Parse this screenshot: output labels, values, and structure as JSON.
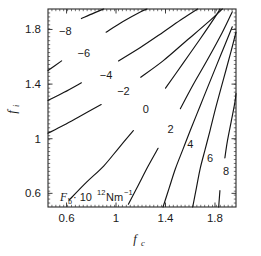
{
  "chart_data": {
    "type": "line",
    "title": "",
    "subtitle": "",
    "xlabel": "f_c",
    "ylabel": "f_i",
    "xlabel_base": "f",
    "xlabel_sub": "c",
    "ylabel_base": "f",
    "ylabel_sub": "i",
    "annotation": "F_b · 10^12 Nm^-1",
    "annotation_parts": {
      "base": "F",
      "sub": "b",
      "mid": "· 10",
      "sup": "12",
      "unit": "Nm",
      "unit_sup": "−1"
    },
    "grid": false,
    "legend": "none",
    "xlim": [
      0.45,
      1.97
    ],
    "ylim": [
      0.5,
      1.95
    ],
    "xticks": [
      0.6,
      1.0,
      1.4,
      1.8
    ],
    "xticklabels": [
      "0.6",
      "1",
      "1.4",
      "1.8"
    ],
    "yticks": [
      0.6,
      1.0,
      1.4,
      1.8
    ],
    "yticklabels": [
      "0.6",
      "1",
      "1.4",
      "1.8"
    ],
    "contour_levels": [
      -8,
      -6,
      -4,
      -2,
      0,
      2,
      4,
      6,
      8
    ],
    "contour_labels": [
      "−8",
      "−6",
      "−4",
      "−2",
      "0",
      "2",
      "4",
      "6",
      "8"
    ],
    "contours": [
      {
        "level": -8,
        "label": "−8",
        "label_xy": [
          0.59,
          1.79
        ],
        "points": [
          [
            0.45,
            1.73
          ],
          [
            0.56,
            1.8
          ],
          [
            0.63,
            1.84
          ],
          [
            0.72,
            1.88
          ],
          [
            0.82,
            1.92
          ],
          [
            0.9,
            1.95
          ]
        ]
      },
      {
        "level": -6,
        "label": "−6",
        "label_xy": [
          0.74,
          1.63
        ],
        "points": [
          [
            0.45,
            1.5
          ],
          [
            0.56,
            1.57
          ],
          [
            0.66,
            1.63
          ],
          [
            0.78,
            1.7
          ],
          [
            0.92,
            1.78
          ],
          [
            1.06,
            1.86
          ],
          [
            1.2,
            1.93
          ],
          [
            1.25,
            1.95
          ]
        ]
      },
      {
        "level": -4,
        "label": "−4",
        "label_xy": [
          0.92,
          1.47
        ],
        "points": [
          [
            0.45,
            1.28
          ],
          [
            0.58,
            1.34
          ],
          [
            0.72,
            1.41
          ],
          [
            0.86,
            1.48
          ],
          [
            1.02,
            1.57
          ],
          [
            1.2,
            1.67
          ],
          [
            1.38,
            1.78
          ],
          [
            1.54,
            1.88
          ],
          [
            1.66,
            1.95
          ]
        ]
      },
      {
        "level": -2,
        "label": "−2",
        "label_xy": [
          1.06,
          1.35
        ],
        "points": [
          [
            0.45,
            1.04
          ],
          [
            0.58,
            1.1
          ],
          [
            0.72,
            1.17
          ],
          [
            0.88,
            1.25
          ],
          [
            1.04,
            1.34
          ],
          [
            1.2,
            1.45
          ],
          [
            1.38,
            1.57
          ],
          [
            1.56,
            1.71
          ],
          [
            1.74,
            1.85
          ],
          [
            1.86,
            1.95
          ]
        ]
      },
      {
        "level": 0,
        "label": "0",
        "label_xy": [
          1.24,
          1.22
        ],
        "points": [
          [
            0.62,
            0.55
          ],
          [
            0.76,
            0.68
          ],
          [
            0.9,
            0.8
          ],
          [
            1.02,
            0.93
          ],
          [
            1.14,
            1.06
          ],
          [
            1.26,
            1.2
          ],
          [
            1.4,
            1.37
          ],
          [
            1.54,
            1.55
          ],
          [
            1.68,
            1.73
          ],
          [
            1.8,
            1.89
          ],
          [
            1.84,
            1.95
          ]
        ]
      },
      {
        "level": 2,
        "label": "2",
        "label_xy": [
          1.44,
          1.07
        ],
        "points": [
          [
            1.1,
            0.52
          ],
          [
            1.18,
            0.66
          ],
          [
            1.26,
            0.8
          ],
          [
            1.34,
            0.93
          ],
          [
            1.42,
            1.06
          ],
          [
            1.52,
            1.22
          ],
          [
            1.62,
            1.39
          ],
          [
            1.74,
            1.58
          ],
          [
            1.86,
            1.78
          ],
          [
            1.94,
            1.93
          ]
        ]
      },
      {
        "level": 4,
        "label": "4",
        "label_xy": [
          1.6,
          0.96
        ],
        "points": [
          [
            1.38,
            0.5
          ],
          [
            1.43,
            0.64
          ],
          [
            1.48,
            0.78
          ],
          [
            1.54,
            0.92
          ],
          [
            1.6,
            1.06
          ],
          [
            1.68,
            1.24
          ],
          [
            1.76,
            1.42
          ],
          [
            1.85,
            1.62
          ],
          [
            1.94,
            1.82
          ]
        ]
      },
      {
        "level": 6,
        "label": "6",
        "label_xy": [
          1.76,
          0.86
        ],
        "points": [
          [
            1.62,
            0.5
          ],
          [
            1.65,
            0.64
          ],
          [
            1.68,
            0.78
          ],
          [
            1.72,
            0.92
          ],
          [
            1.76,
            1.06
          ],
          [
            1.81,
            1.24
          ],
          [
            1.87,
            1.44
          ],
          [
            1.93,
            1.64
          ],
          [
            1.97,
            1.78
          ]
        ]
      },
      {
        "level": 8,
        "label": "8",
        "label_xy": [
          1.89,
          0.76
        ],
        "points": [
          [
            1.83,
            0.5
          ],
          [
            1.84,
            0.62
          ],
          [
            1.86,
            0.74
          ],
          [
            1.88,
            0.86
          ],
          [
            1.9,
            0.98
          ],
          [
            1.93,
            1.12
          ],
          [
            1.96,
            1.26
          ],
          [
            1.97,
            1.33
          ]
        ]
      }
    ]
  },
  "plot": {
    "frame": {
      "left": 48,
      "top": 9,
      "right": 236,
      "bottom": 207
    },
    "axis_color": "#2a2a2a",
    "line_color": "#141414",
    "background": "#ffffff"
  }
}
